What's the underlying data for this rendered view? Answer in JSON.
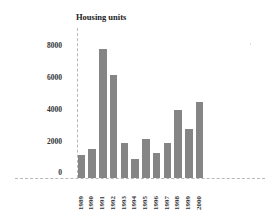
{
  "chart_data": {
    "type": "bar",
    "title": "Housing units",
    "xlabel": "",
    "ylabel": "Housing units",
    "categories": [
      "1989",
      "1990",
      "1991",
      "1992",
      "1993",
      "1994",
      "1995",
      "1996",
      "1997",
      "1998",
      "1999",
      "2000"
    ],
    "values": [
      1400,
      1750,
      7900,
      6300,
      2150,
      1150,
      2400,
      1550,
      2150,
      4150,
      3000,
      4650
    ],
    "ylim": [
      0,
      8000
    ],
    "yticks": [
      "0",
      "2000",
      "4000",
      "6000",
      "8000"
    ],
    "grid": false,
    "legend": null,
    "bar_color": "#858585",
    "xtick_rotation": -90
  },
  "labels": {
    "title": "Housing units",
    "yticks": [
      "8000",
      "6000",
      "4000",
      "2000",
      "0"
    ],
    "xticks": [
      "1989",
      "1990",
      "1991",
      "1992",
      "1993",
      "1994",
      "1995",
      "1996",
      "1997",
      "1998",
      "1999",
      "2000"
    ]
  }
}
